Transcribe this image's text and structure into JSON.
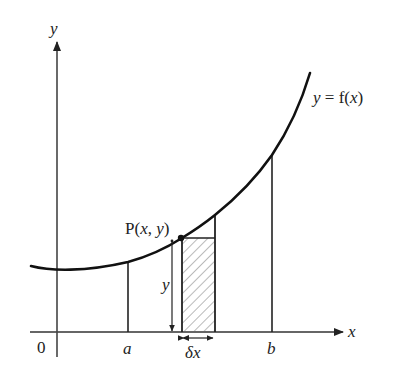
{
  "diagram": {
    "axes": {
      "x_label": "x",
      "y_label": "y",
      "origin_label": "0"
    },
    "curve": {
      "label_y": "y",
      "label_eq": " = f(",
      "label_x": "x",
      "label_close": ")"
    },
    "bounds": {
      "a_label": "a",
      "b_label": "b"
    },
    "point": {
      "label_prefix": "P(",
      "label_x": "x",
      "label_sep": ", ",
      "label_y": "y",
      "label_suffix": ")"
    },
    "strip": {
      "height_label": "y",
      "width_label_delta": "δ",
      "width_label_x": "x"
    },
    "colors": {
      "ink": "#222222",
      "axis": "#333333",
      "hatch": "#555555",
      "background": "#ffffff"
    }
  }
}
